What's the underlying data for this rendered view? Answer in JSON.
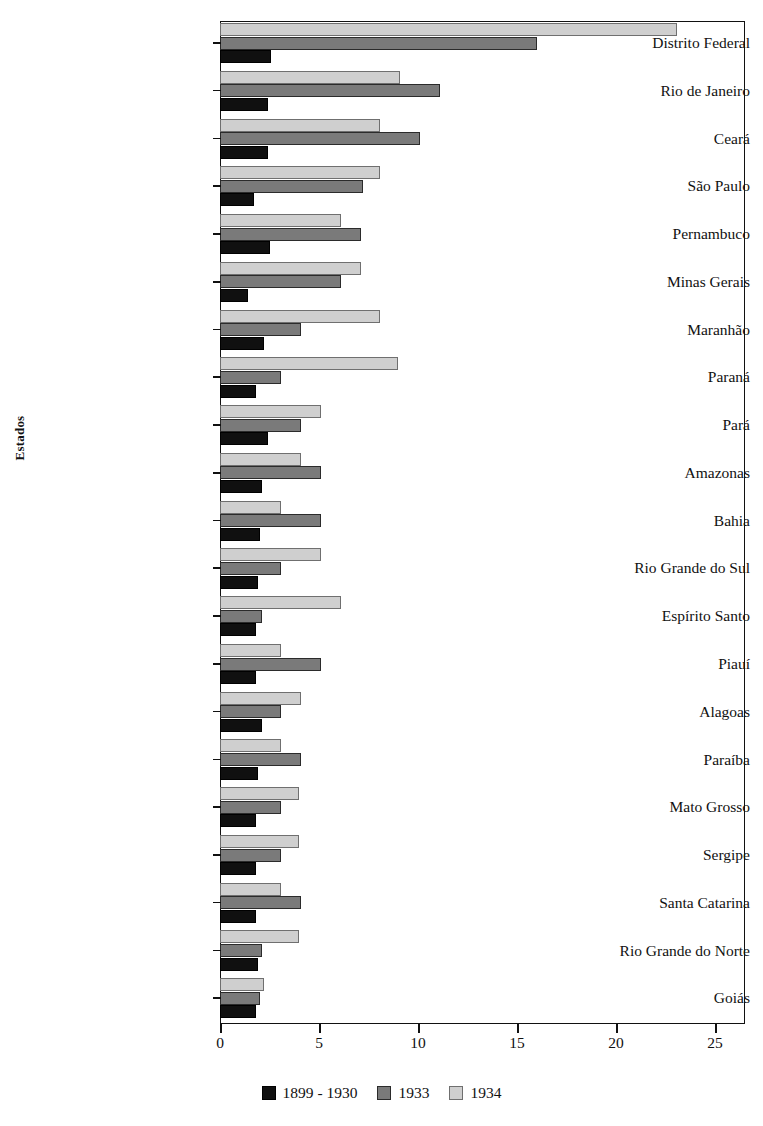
{
  "chart_data": {
    "type": "bar",
    "orientation": "horizontal",
    "title": "",
    "xlabel": "",
    "ylabel": "Estados",
    "xlim": [
      0,
      25
    ],
    "xticks": [
      0,
      5,
      10,
      15,
      20,
      25
    ],
    "xtick_labels": [
      "0",
      "5",
      "10",
      "15",
      "20",
      "25"
    ],
    "grid": false,
    "legend_position": "bottom-center",
    "categories": [
      "Distrito Federal",
      "Rio de Janeiro",
      "Ceará",
      "São Paulo",
      "Pernambuco",
      "Minas Gerais",
      "Maranhão",
      "Paraná",
      "Pará",
      "Amazonas",
      "Bahia",
      "Rio Grande do Sul",
      "Espírito Santo",
      "Piauí",
      "Alagoas",
      "Paraíba",
      "Mato Grosso",
      "Sergipe",
      "Santa Catarina",
      "Rio Grande do Norte",
      "Goiás"
    ],
    "series": [
      {
        "name": "1899 - 1930",
        "color": "#101010",
        "values": [
          2.6,
          2.4,
          2.4,
          1.7,
          2.5,
          1.4,
          2.2,
          1.8,
          2.4,
          2.1,
          2.0,
          1.9,
          1.8,
          1.8,
          2.1,
          1.9,
          1.8,
          1.8,
          1.8,
          1.9,
          1.8
        ]
      },
      {
        "name": "1933",
        "color": "#7a7a7a",
        "values": [
          16.0,
          11.1,
          10.1,
          7.2,
          7.1,
          6.1,
          4.1,
          3.1,
          4.1,
          5.1,
          5.1,
          3.1,
          2.1,
          5.1,
          3.1,
          4.1,
          3.1,
          3.1,
          4.1,
          2.1,
          2.0
        ]
      },
      {
        "name": "1934",
        "color": "#cfcfcf",
        "values": [
          23.1,
          9.1,
          8.1,
          8.1,
          6.1,
          7.1,
          8.1,
          9.0,
          5.1,
          4.1,
          3.1,
          5.1,
          6.1,
          3.1,
          4.1,
          3.1,
          4.0,
          4.0,
          3.1,
          4.0,
          2.2
        ]
      }
    ]
  },
  "legend": {
    "items": [
      {
        "label": "1899 - 1930"
      },
      {
        "label": "1933"
      },
      {
        "label": "1934"
      }
    ]
  }
}
